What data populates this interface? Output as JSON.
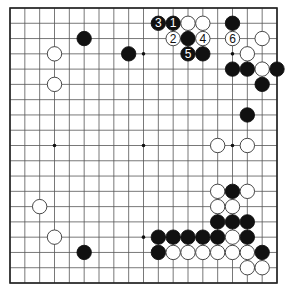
{
  "diagram": {
    "type": "go-board",
    "size": 19,
    "colors": {
      "background": "#ffffff",
      "line": "#555555",
      "black": "#111111",
      "white": "#ffffff",
      "border": "#222222"
    },
    "hoshi": [
      [
        4,
        4
      ],
      [
        10,
        4
      ],
      [
        16,
        4
      ],
      [
        4,
        10
      ],
      [
        10,
        10
      ],
      [
        16,
        10
      ],
      [
        4,
        16
      ],
      [
        10,
        16
      ],
      [
        16,
        16
      ]
    ],
    "stones": [
      {
        "col": 11,
        "row": 2,
        "color": "black",
        "label": "3"
      },
      {
        "col": 12,
        "row": 2,
        "color": "black",
        "label": "1"
      },
      {
        "col": 13,
        "row": 2,
        "color": "white"
      },
      {
        "col": 14,
        "row": 2,
        "color": "white"
      },
      {
        "col": 16,
        "row": 2,
        "color": "black"
      },
      {
        "col": 12,
        "row": 3,
        "color": "white",
        "label": "2"
      },
      {
        "col": 13,
        "row": 3,
        "color": "black"
      },
      {
        "col": 14,
        "row": 3,
        "color": "white",
        "label": "4"
      },
      {
        "col": 16,
        "row": 3,
        "color": "white",
        "label": "6"
      },
      {
        "col": 18,
        "row": 3,
        "color": "white"
      },
      {
        "col": 6,
        "row": 3,
        "color": "black"
      },
      {
        "col": 4,
        "row": 4,
        "color": "white"
      },
      {
        "col": 9,
        "row": 4,
        "color": "black"
      },
      {
        "col": 13,
        "row": 4,
        "color": "black",
        "label": "5"
      },
      {
        "col": 14,
        "row": 4,
        "color": "black"
      },
      {
        "col": 17,
        "row": 4,
        "color": "white"
      },
      {
        "col": 16,
        "row": 5,
        "color": "black"
      },
      {
        "col": 17,
        "row": 5,
        "color": "black"
      },
      {
        "col": 18,
        "row": 5,
        "color": "white"
      },
      {
        "col": 19,
        "row": 5,
        "color": "black"
      },
      {
        "col": 4,
        "row": 6,
        "color": "white"
      },
      {
        "col": 18,
        "row": 6,
        "color": "black"
      },
      {
        "col": 17,
        "row": 8,
        "color": "black"
      },
      {
        "col": 15,
        "row": 10,
        "color": "white"
      },
      {
        "col": 17,
        "row": 10,
        "color": "white"
      },
      {
        "col": 15,
        "row": 13,
        "color": "white"
      },
      {
        "col": 16,
        "row": 13,
        "color": "black"
      },
      {
        "col": 17,
        "row": 13,
        "color": "white"
      },
      {
        "col": 3,
        "row": 14,
        "color": "white"
      },
      {
        "col": 15,
        "row": 14,
        "color": "white"
      },
      {
        "col": 16,
        "row": 14,
        "color": "white"
      },
      {
        "col": 15,
        "row": 15,
        "color": "black"
      },
      {
        "col": 16,
        "row": 15,
        "color": "black"
      },
      {
        "col": 17,
        "row": 15,
        "color": "black"
      },
      {
        "col": 4,
        "row": 16,
        "color": "white"
      },
      {
        "col": 11,
        "row": 16,
        "color": "black"
      },
      {
        "col": 12,
        "row": 16,
        "color": "black"
      },
      {
        "col": 13,
        "row": 16,
        "color": "black"
      },
      {
        "col": 14,
        "row": 16,
        "color": "black"
      },
      {
        "col": 15,
        "row": 16,
        "color": "black"
      },
      {
        "col": 16,
        "row": 16,
        "color": "white"
      },
      {
        "col": 17,
        "row": 16,
        "color": "black"
      },
      {
        "col": 6,
        "row": 17,
        "color": "black"
      },
      {
        "col": 11,
        "row": 17,
        "color": "black"
      },
      {
        "col": 12,
        "row": 17,
        "color": "white"
      },
      {
        "col": 13,
        "row": 17,
        "color": "white"
      },
      {
        "col": 14,
        "row": 17,
        "color": "white"
      },
      {
        "col": 15,
        "row": 17,
        "color": "white"
      },
      {
        "col": 16,
        "row": 17,
        "color": "white"
      },
      {
        "col": 17,
        "row": 17,
        "color": "white"
      },
      {
        "col": 18,
        "row": 17,
        "color": "black"
      },
      {
        "col": 17,
        "row": 18,
        "color": "white"
      },
      {
        "col": 18,
        "row": 18,
        "color": "white"
      }
    ]
  }
}
